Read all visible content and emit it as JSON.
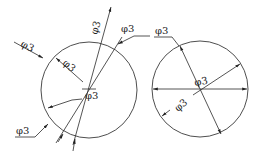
{
  "figure": {
    "left_circle": {
      "labels": [
        {
          "id": "outer_left_leader",
          "text": "φ3"
        },
        {
          "id": "inner_radial",
          "text": "φ3"
        },
        {
          "id": "top_diagonal",
          "text": "φ3"
        },
        {
          "id": "top_right_leader",
          "text": "φ3"
        },
        {
          "id": "center",
          "text": "φ3"
        },
        {
          "id": "bottom_left_leader",
          "text": "φ3"
        }
      ]
    },
    "right_circle": {
      "labels": [
        {
          "id": "top_leader",
          "text": "φ3"
        },
        {
          "id": "center",
          "text": "φ3"
        },
        {
          "id": "lower_left",
          "text": "φ3"
        }
      ]
    },
    "colors": {
      "line": "#2a2a2a",
      "background": "#ffffff"
    }
  }
}
